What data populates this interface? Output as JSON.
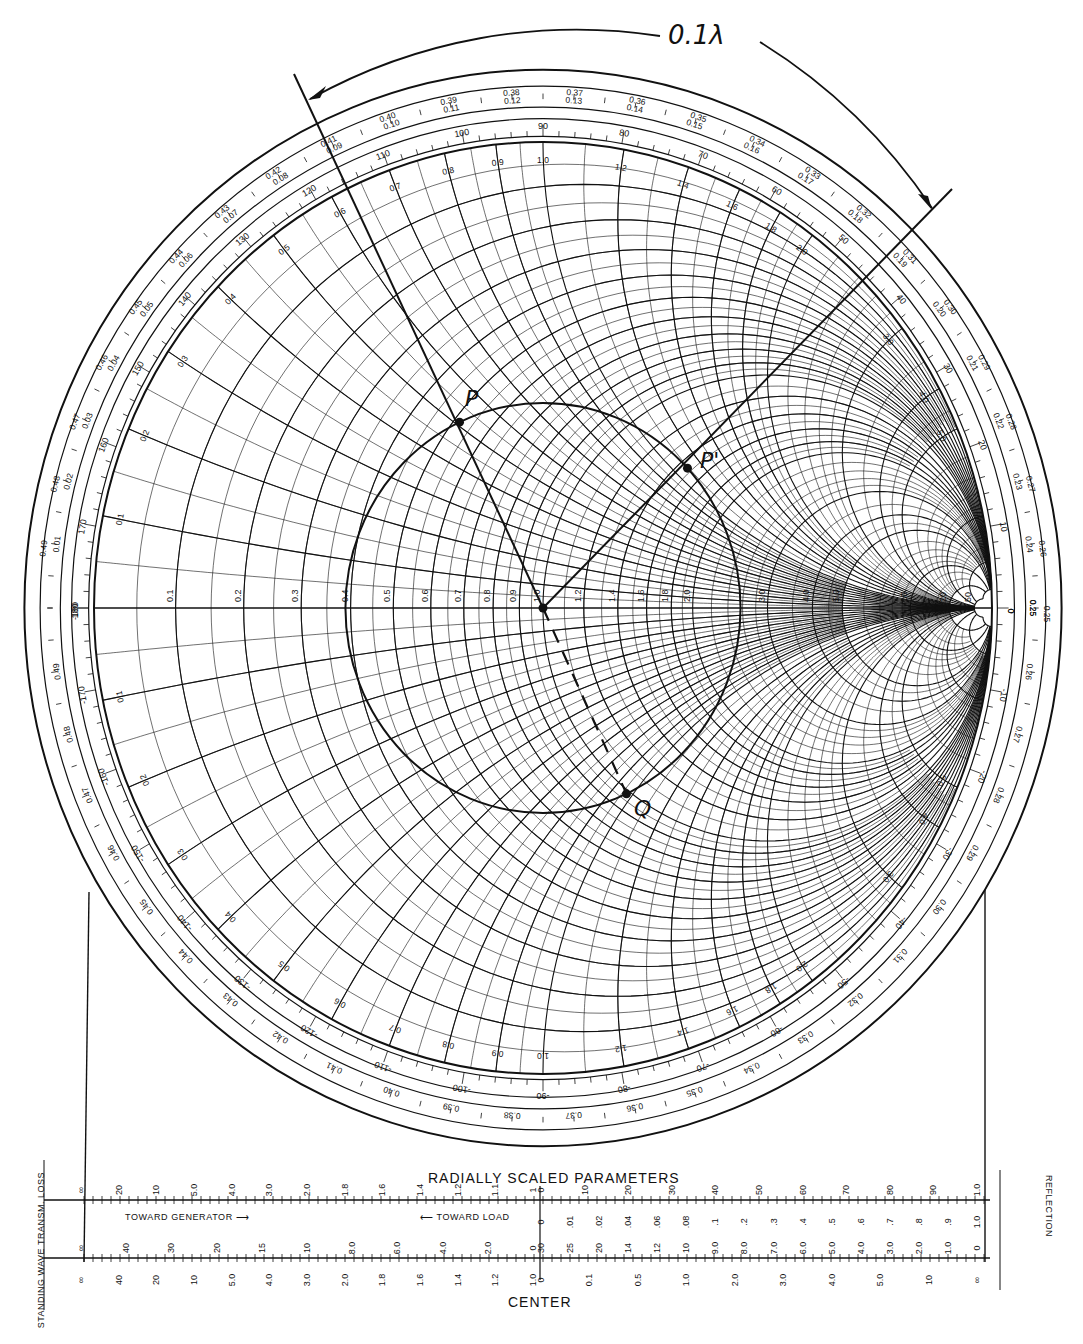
{
  "annotation": {
    "arc_label": "0.1λ",
    "points": [
      {
        "name": "P",
        "label": "P"
      },
      {
        "name": "P-prime",
        "label": "P'"
      },
      {
        "name": "Q",
        "label": "Q"
      }
    ]
  },
  "chart_labels": {
    "resistance_axis": "RESISTANCE COMPONENT (R/Z0), OR CONDUCTANCE COMPONENT (G/Y0)",
    "inductive": "INDUCTIVE REACTANCE COMPONENT (+jX/Z0) OR CAPACITIVE SUSCEPTANCE COMPONENT (+jB/Y0)",
    "capacitive": "CAPACITIVE REACTANCE COMPONENT (-jX/Z0) OR INDUCTIVE SUSCEPTANCE COMPONENT (-jB/Y0)",
    "toward_generator": "WAVELENGTHS TOWARD GENERATOR",
    "toward_load": "WAVELENGTHS TOWARD LOAD",
    "angle": "ANGLE OF REFLECTION COEFFICIENT IN DEGREES"
  },
  "bottom_scales": {
    "title": "RADIALLY SCALED PARAMETERS",
    "center": "CENTER",
    "toward_generator": "TOWARD GENERATOR ⟶",
    "toward_load": "⟵ TOWARD LOAD",
    "left_headers": [
      "TRANSM. LOSS",
      "LOSS COEF",
      "1 DB STEPS",
      "STANDING WAVE",
      "IN DB",
      "VOL RATIO"
    ],
    "right_headers": [
      "REFLECTION",
      "REFL. COEF",
      "VOL",
      "PWR",
      "LOSS IN DB",
      "RETN",
      "REFL"
    ],
    "row1_left": [
      "∞",
      "20",
      "10",
      "5.0",
      "4.0",
      "3.0",
      "2.0",
      "1.8",
      "1.6",
      "1.4",
      "1.2",
      "1.1",
      "1"
    ],
    "row1_right": [
      "0",
      "10",
      "20",
      "30",
      "40",
      "50",
      "60",
      "70",
      "80",
      "90",
      "1.0"
    ],
    "row2_right": [
      "0",
      ".01",
      ".02",
      ".04",
      ".06",
      ".08",
      ".1",
      ".2",
      ".3",
      ".4",
      ".5",
      ".6",
      ".7",
      ".8",
      ".9",
      "1.0"
    ],
    "row3_left": [
      "∞",
      "40",
      "30",
      "20",
      "15",
      "10",
      "8.0",
      "6.0",
      "4.0",
      "2.0",
      "0"
    ],
    "row3_right": [
      "30",
      "25",
      "20",
      "14",
      "12",
      "10",
      "9.0",
      "8.0",
      "7.0",
      "6.0",
      "5.0",
      "4.0",
      "3.0",
      "2.0",
      "1.0",
      "0"
    ],
    "row4_left": [
      "∞",
      "40",
      "20",
      "10",
      "5.0",
      "4.0",
      "3.0",
      "2.0",
      "1.8",
      "1.6",
      "1.4",
      "1.2",
      "1.0"
    ],
    "row4_right": [
      "0",
      "0.1",
      "0.5",
      "1.0",
      "2.0",
      "3.0",
      "4.0",
      "5.0",
      "10",
      "∞"
    ]
  },
  "chart_data": {
    "type": "smith_chart",
    "resistance_values": [
      0.1,
      0.2,
      0.3,
      0.4,
      0.5,
      0.6,
      0.7,
      0.8,
      0.9,
      1.0,
      1.2,
      1.4,
      1.6,
      1.8,
      2.0,
      3.0,
      4.0,
      5.0,
      10,
      20,
      50
    ],
    "reactance_values": [
      0.1,
      0.2,
      0.3,
      0.4,
      0.5,
      0.6,
      0.7,
      0.8,
      0.9,
      1.0,
      1.2,
      1.4,
      1.6,
      1.8,
      2.0,
      3.0,
      4.0,
      5.0,
      10,
      20,
      50
    ],
    "angle_ticks_deg": [
      0,
      10,
      20,
      30,
      40,
      50,
      60,
      70,
      80,
      90,
      100,
      110,
      120,
      130,
      140,
      150,
      160,
      170,
      180
    ],
    "wavelength_ticks": [
      0.0,
      0.01,
      0.02,
      0.03,
      0.04,
      0.05,
      0.06,
      0.07,
      0.08,
      0.09,
      0.1,
      0.11,
      0.12,
      0.13,
      0.14,
      0.15,
      0.16,
      0.17,
      0.18,
      0.19,
      0.2,
      0.21,
      0.22,
      0.23,
      0.24,
      0.25
    ],
    "swr_circle_radius_gamma": 0.44,
    "points": [
      {
        "label": "P",
        "gamma_mag": 0.44,
        "angle_deg": 115
      },
      {
        "label": "P'",
        "gamma_mag": 0.44,
        "angle_deg": 43
      },
      {
        "label": "Q",
        "gamma_mag": 0.44,
        "angle_deg": -65
      }
    ],
    "rotation": {
      "label": "0.1λ",
      "direction": "toward generator (clockwise)",
      "degrees": 72
    },
    "annotations": [
      "P",
      "P'",
      "Q",
      "0.1λ"
    ]
  }
}
